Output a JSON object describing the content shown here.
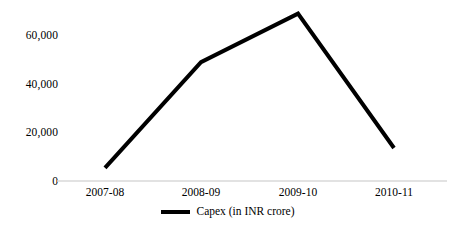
{
  "chart_data": {
    "type": "line",
    "title": "",
    "subtitle": "",
    "xlabel": "",
    "ylabel": "",
    "categories": [
      "2007-08",
      "2008-09",
      "2009-10",
      "2010-11"
    ],
    "series": [
      {
        "name": "Capex (in INR crore)",
        "values": [
          5400,
          49000,
          69000,
          13600
        ],
        "color": "#000000"
      }
    ],
    "ylim": [
      0,
      70000
    ],
    "ytick_labels": [
      "0",
      "20,000",
      "40,000",
      "60,000"
    ],
    "ytick_values": [
      0,
      20000,
      40000,
      60000
    ],
    "grid": false,
    "legend_position": "bottom",
    "axis_line_color": "#d9d9d9",
    "line_color": "#000000",
    "line_width": 4,
    "background_color": "#ffffff"
  },
  "legend": {
    "entries": [
      {
        "label": "Capex (in INR crore)",
        "marker": "line-marker"
      }
    ]
  }
}
